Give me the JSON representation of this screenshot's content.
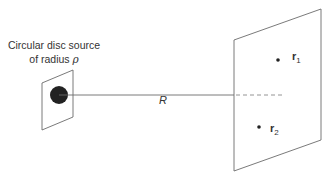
{
  "source": {
    "label_line1": "Circular disc source",
    "label_line2_prefix": "of radius ",
    "radius_symbol": "ρ"
  },
  "distance": {
    "label": "R"
  },
  "points": [
    {
      "name": "r",
      "subscript": "1"
    },
    {
      "name": "r",
      "subscript": "2"
    }
  ],
  "colors": {
    "line": "#6b6b6b",
    "disc": "#222222",
    "text": "#333333"
  }
}
